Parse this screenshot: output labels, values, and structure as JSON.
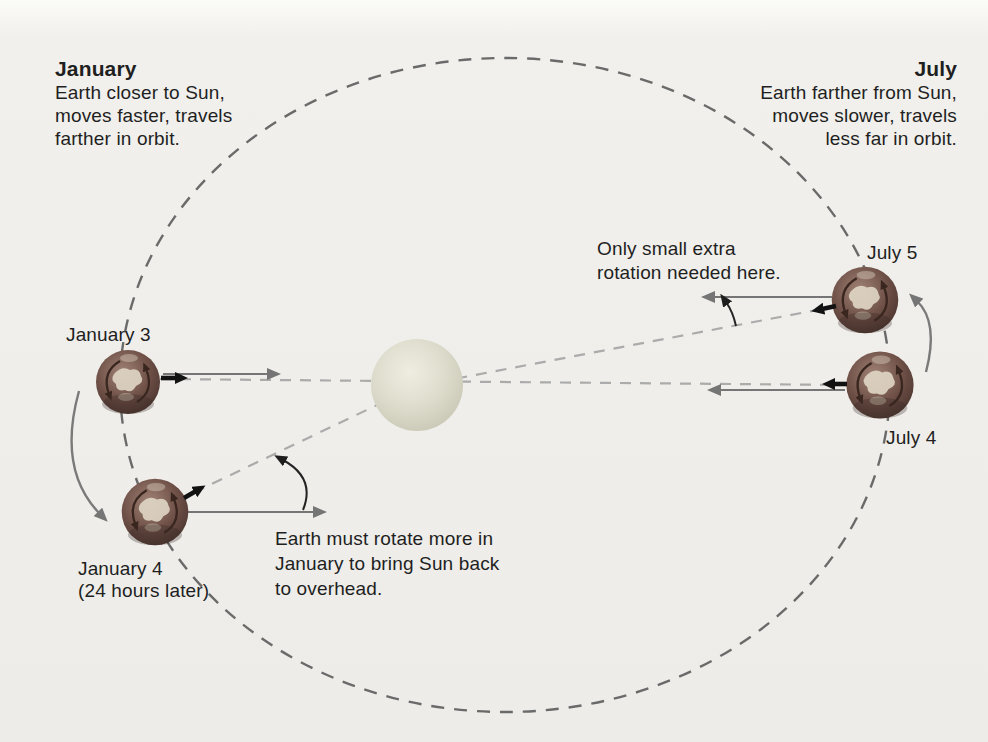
{
  "figure": {
    "january": {
      "heading": "January",
      "desc1": "Earth closer to Sun,",
      "desc2": "moves faster, travels",
      "desc3": "farther in orbit.",
      "earth1_label": "January 3",
      "earth2_label": "January 4",
      "earth2_sublabel": "(24 hours later)",
      "note1": "Earth must rotate more in",
      "note2": "January to bring Sun back",
      "note3": "to overhead."
    },
    "july": {
      "heading": "July",
      "desc1": "Earth farther from Sun,",
      "desc2": "moves slower, travels",
      "desc3": "less far in orbit.",
      "upper_earth_label": "July 5",
      "lower_earth_label": "July 4",
      "note1": "Only small extra",
      "note2": "rotation needed here."
    },
    "colors": {
      "background": "#efeeea",
      "orbit_dash": "#6a6a6a",
      "sightline_dash": "#ababab",
      "reference_arrow": "#757575",
      "marker_arrow": "#121212",
      "sun_fill": "#dcdbcb",
      "earth_fill": "#6d4f46",
      "text": "#1f1f1f"
    }
  }
}
